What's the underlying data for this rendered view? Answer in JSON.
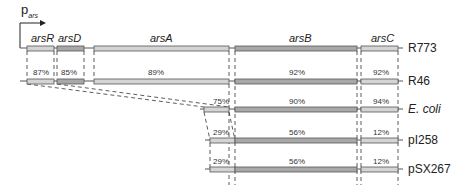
{
  "promoter": {
    "p": "p",
    "sub": "ars"
  },
  "genes": [
    {
      "name": "arsR",
      "x1": 27,
      "x2": 54
    },
    {
      "name": "arsD",
      "x1": 57,
      "x2": 84
    },
    {
      "name": "arsA",
      "x1": 94,
      "x2": 229
    },
    {
      "name": "arsB",
      "x1": 235,
      "x2": 357
    },
    {
      "name": "arsC",
      "x1": 361,
      "x2": 398
    }
  ],
  "rows": [
    {
      "label": "R773",
      "italic": false,
      "y": 48
    },
    {
      "label": "R46",
      "italic": false,
      "y": 81,
      "pcts": [
        "87%",
        "85%",
        "89%",
        "92%",
        "92%"
      ]
    },
    {
      "label": "E. coli",
      "italic": true,
      "y": 109,
      "pcts": [
        "75%",
        "90%",
        "94%"
      ]
    },
    {
      "label": "pI258",
      "italic": false,
      "y": 140,
      "pcts": [
        "29%",
        "56%",
        "12%"
      ]
    },
    {
      "label": "pSX267",
      "italic": false,
      "y": 169,
      "pcts": [
        "29%",
        "56%",
        "12%"
      ]
    }
  ],
  "colors": {
    "light": "#d4d4d4",
    "dark": "#a8a8a8",
    "outline": "#555555"
  }
}
